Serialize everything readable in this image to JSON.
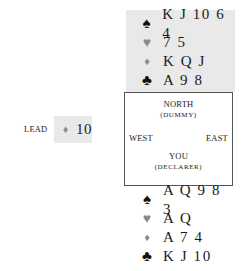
{
  "north": {
    "label": "NORTH",
    "sublabel": "(DUMMY)",
    "hand": [
      {
        "suit": "spades",
        "icon": "♠",
        "cards": "K J 10 6 4",
        "color": "#111111"
      },
      {
        "suit": "hearts",
        "icon": "♥",
        "cards": "7 5",
        "color": "#8a8a8a"
      },
      {
        "suit": "diamonds",
        "icon": "♦",
        "cards": "K Q J",
        "color": "#8a8a8a"
      },
      {
        "suit": "clubs",
        "icon": "♣",
        "cards": "A 9 8",
        "color": "#111111"
      }
    ]
  },
  "south": {
    "label": "YOU",
    "sublabel": "(DECLARER)",
    "hand": [
      {
        "suit": "spades",
        "icon": "♠",
        "cards": "A Q 9 8 3",
        "color": "#111111"
      },
      {
        "suit": "hearts",
        "icon": "♥",
        "cards": "A Q",
        "color": "#8a8a8a"
      },
      {
        "suit": "diamonds",
        "icon": "♦",
        "cards": "A 7 4",
        "color": "#8a8a8a"
      },
      {
        "suit": "clubs",
        "icon": "♣",
        "cards": "K J 10",
        "color": "#111111"
      }
    ]
  },
  "west": {
    "label": "WEST"
  },
  "east": {
    "label": "EAST"
  },
  "lead": {
    "label": "LEAD",
    "suit": "diamonds",
    "icon": "♦",
    "card": "10"
  },
  "colors": {
    "highlight_bg": "#e9e9e9",
    "black_suit": "#111111",
    "red_suit": "#8a8a8a",
    "border": "#555555"
  }
}
